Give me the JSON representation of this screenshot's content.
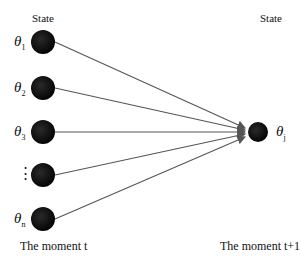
{
  "header": {
    "left_label": "State",
    "right_label": "State"
  },
  "footer": {
    "left_label": "The moment t",
    "right_label": "The moment t+1"
  },
  "nodes_left": [
    {
      "symbol": "θ",
      "sub": "1",
      "y": 42
    },
    {
      "symbol": "θ",
      "sub": "2",
      "y": 88
    },
    {
      "symbol": "θ",
      "sub": "3",
      "y": 132
    },
    {
      "symbol": "⋮",
      "sub": "",
      "y": 175
    },
    {
      "symbol": "θ",
      "sub": "n",
      "y": 219
    }
  ],
  "node_right": {
    "symbol": "θ",
    "sub": "j"
  },
  "colors": {
    "node": "#111111",
    "edge": "#555555"
  }
}
